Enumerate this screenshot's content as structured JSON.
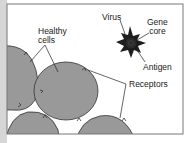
{
  "diagram": {
    "labels": {
      "healthy_cells": [
        "Healthy",
        "cells"
      ],
      "virus": "Virus",
      "gene_core": [
        "Gene",
        "core"
      ],
      "antigen": "Antigen",
      "receptors": "Receptors"
    },
    "colors": {
      "cell_fill": "#999999",
      "cell_stroke": "#333333",
      "virus_fill": "#1e1e1e",
      "frame": "#777777",
      "left_strip": "#d6d6d6"
    }
  }
}
